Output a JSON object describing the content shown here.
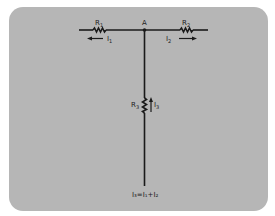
{
  "diagram": {
    "type": "circuit",
    "node": {
      "label": "A"
    },
    "resistors": [
      {
        "id": "R1",
        "label": "R",
        "sub": "1"
      },
      {
        "id": "R2",
        "label": "R",
        "sub": "2"
      },
      {
        "id": "R3",
        "label": "R",
        "sub": "3"
      }
    ],
    "currents": [
      {
        "id": "I1",
        "label": "I",
        "sub": "1",
        "direction": "left"
      },
      {
        "id": "I2",
        "label": "I",
        "sub": "2",
        "direction": "right"
      },
      {
        "id": "I3",
        "label": "I",
        "sub": "3",
        "direction": "up"
      }
    ],
    "equation": {
      "text": "I₃=I₁+I₂"
    },
    "colors": {
      "panel": "#b6b6b6",
      "wire": "#1a1a1a"
    }
  }
}
